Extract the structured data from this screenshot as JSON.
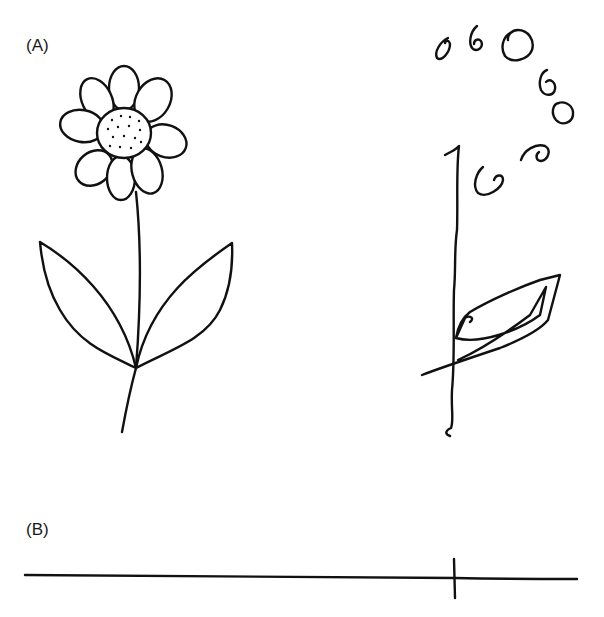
{
  "figure": {
    "panels": [
      {
        "id": "A",
        "label": "(A)",
        "description": "Model drawing of a daisy flower (left) and a patient's copy (right) showing fragmented, disorganized reproduction",
        "items": [
          {
            "name": "model-flower",
            "parts": [
              "8 petals",
              "dotted center disc",
              "stem",
              "2 leaves"
            ]
          },
          {
            "name": "copied-flower",
            "parts": [
              "scattered loops (petals)",
              "vertical stem line",
              "crossed leaf scribble"
            ]
          }
        ]
      },
      {
        "id": "B",
        "label": "(B)",
        "description": "Line bisection task: horizontal line with a bisection mark placed far to the right of center",
        "line": {
          "x_start": 25,
          "x_end": 577,
          "y": 578
        },
        "mark": {
          "x": 455,
          "y_top": 560,
          "y_bottom": 598
        }
      }
    ],
    "colors": {
      "ink": "#111111",
      "background": "#ffffff"
    }
  }
}
